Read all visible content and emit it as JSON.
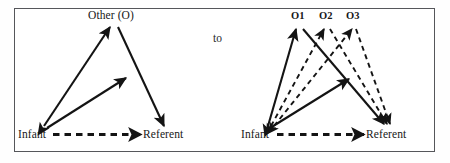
{
  "figure": {
    "connector": "to",
    "frame_color": "#55565a",
    "ink_color": "#141414",
    "background": "#ffffff"
  },
  "left_panel": {
    "name": "single-other-triad",
    "nodes": [
      {
        "id": "other",
        "label": "Other (O)",
        "x": 120,
        "y": 22
      },
      {
        "id": "infant",
        "label": "Infant",
        "x": 36,
        "y": 134
      },
      {
        "id": "referent",
        "label": "Referent",
        "x": 165,
        "y": 134
      }
    ],
    "edges": [
      {
        "from": "infant",
        "to": "other",
        "style": "solid",
        "heads": "both"
      },
      {
        "from": "other",
        "to": "referent",
        "style": "solid",
        "heads": "end"
      },
      {
        "from": "infant",
        "to": "midline",
        "style": "solid",
        "heads": "end"
      },
      {
        "from": "infant",
        "to": "referent",
        "style": "dashed",
        "heads": "end"
      }
    ]
  },
  "right_panel": {
    "name": "multiple-others-triad",
    "nodes": [
      {
        "id": "o1",
        "label": "O1",
        "x": 296,
        "y": 23
      },
      {
        "id": "o2",
        "label": "O2",
        "x": 324,
        "y": 23
      },
      {
        "id": "o3",
        "label": "O3",
        "x": 351,
        "y": 23
      },
      {
        "id": "infant",
        "label": "Infant",
        "x": 259,
        "y": 134
      },
      {
        "id": "referent",
        "label": "Referent",
        "x": 388,
        "y": 134
      }
    ],
    "edges": [
      {
        "from": "infant",
        "to": "o1",
        "style": "solid",
        "heads": "both"
      },
      {
        "from": "infant",
        "to": "o2",
        "style": "dashed",
        "heads": "both"
      },
      {
        "from": "infant",
        "to": "o3",
        "style": "dashed",
        "heads": "both"
      },
      {
        "from": "o1",
        "to": "referent",
        "style": "solid",
        "heads": "end"
      },
      {
        "from": "o2",
        "to": "referent",
        "style": "dashed",
        "heads": "end"
      },
      {
        "from": "o3",
        "to": "referent",
        "style": "dashed",
        "heads": "end"
      },
      {
        "from": "infant",
        "to": "midline",
        "style": "solid",
        "heads": "end"
      },
      {
        "from": "infant",
        "to": "referent",
        "style": "dashed",
        "heads": "end"
      }
    ]
  }
}
